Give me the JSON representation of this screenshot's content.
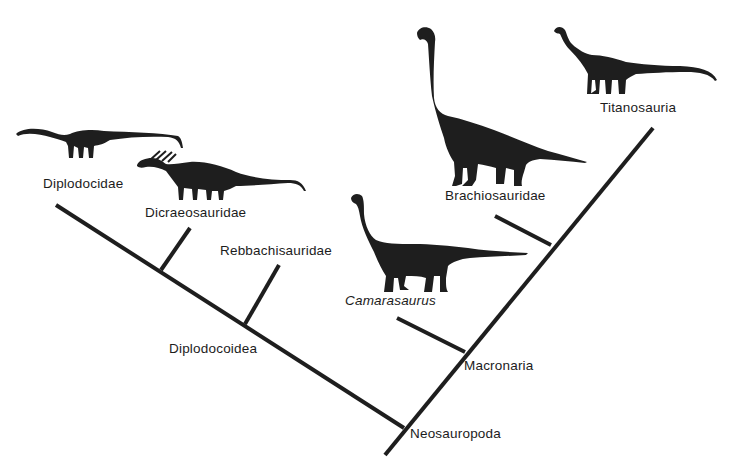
{
  "diagram": {
    "type": "cladogram",
    "ink_color": "#1e1e1e",
    "background": "#ffffff",
    "nodes": [
      {
        "id": "neosauropoda",
        "label": "Neosauropoda",
        "italic": false
      },
      {
        "id": "diplodocoidea",
        "label": "Diplodocoidea",
        "italic": false
      },
      {
        "id": "macronaria",
        "label": "Macronaria",
        "italic": false
      }
    ],
    "taxa": [
      {
        "id": "diplodocidae",
        "label": "Diplodocidae",
        "italic": false,
        "silhouette": "diplodocid-silhouette"
      },
      {
        "id": "dicraeosauridae",
        "label": "Dicraeosauridae",
        "italic": false,
        "silhouette": "dicraeosaurid-silhouette"
      },
      {
        "id": "rebbachisauridae",
        "label": "Rebbachisauridae",
        "italic": false,
        "silhouette": null
      },
      {
        "id": "camarasaurus",
        "label": "Camarasaurus",
        "italic": true,
        "silhouette": "camarasaurus-silhouette"
      },
      {
        "id": "brachiosauridae",
        "label": "Brachiosauridae",
        "italic": false,
        "silhouette": "brachiosaurid-silhouette"
      },
      {
        "id": "titanosauria",
        "label": "Titanosauria",
        "italic": false,
        "silhouette": "titanosaur-silhouette"
      }
    ],
    "edges": [
      {
        "from": "neosauropoda",
        "to": "diplodocoidea"
      },
      {
        "from": "diplodocoidea",
        "to": "diplodocidae"
      },
      {
        "from": "diplodocoidea",
        "to": "dicraeosauridae"
      },
      {
        "from": "diplodocoidea",
        "to": "rebbachisauridae"
      },
      {
        "from": "neosauropoda",
        "to": "macronaria"
      },
      {
        "from": "macronaria",
        "to": "camarasaurus"
      },
      {
        "from": "macronaria",
        "to": "brachiosauridae"
      },
      {
        "from": "macronaria",
        "to": "titanosauria"
      }
    ]
  }
}
